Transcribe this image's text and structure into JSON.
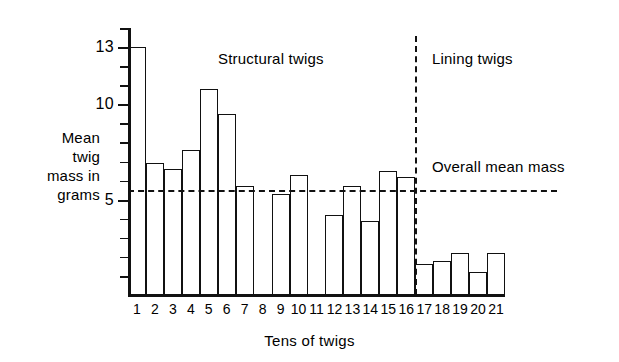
{
  "chart_data": {
    "type": "bar",
    "title": "",
    "xlabel": "Tens of twigs",
    "ylabel": "Mean twig mass in grams",
    "ylabel_lines": [
      "Mean",
      "twig",
      "mass in",
      "grams"
    ],
    "categories": [
      "1",
      "2",
      "3",
      "4",
      "5",
      "6",
      "7",
      "8",
      "9",
      "10",
      "11",
      "12",
      "13",
      "14",
      "15",
      "16",
      "17",
      "18",
      "19",
      "20",
      "21"
    ],
    "values": [
      13.0,
      6.9,
      6.6,
      7.6,
      10.8,
      9.5,
      5.7,
      0,
      5.3,
      6.3,
      0,
      4.2,
      5.7,
      3.9,
      6.5,
      6.2,
      1.6,
      1.8,
      2.2,
      1.2,
      2.2
    ],
    "ylim": [
      0,
      14
    ],
    "xlim": [
      0,
      21
    ],
    "ytick_labels": [
      "5",
      "10",
      "13"
    ],
    "ytick_values": [
      5,
      10,
      13
    ],
    "yminor_ticks": [
      1,
      2,
      3,
      4,
      6,
      7,
      8,
      9,
      11,
      12,
      14
    ],
    "grid": false,
    "legend": "none",
    "annotations": [
      {
        "name": "structural-twigs",
        "text": "Structural twigs",
        "x_category_range": [
          1,
          16
        ]
      },
      {
        "name": "lining-twigs",
        "text": "Lining twigs",
        "x_category_range": [
          17,
          21
        ]
      },
      {
        "name": "overall-mean-mass",
        "text": "Overall mean mass",
        "value": 5.5
      }
    ],
    "reference_lines": [
      {
        "name": "overall-mean-mass-line",
        "orientation": "horizontal",
        "value": 5.5,
        "style": "dashed"
      },
      {
        "name": "group-divider-line",
        "orientation": "vertical",
        "at_category": "16/17 boundary",
        "style": "dashed"
      }
    ],
    "colors": {
      "axis": "#111111",
      "bar_stroke": "#111111",
      "bar_fill": "transparent",
      "background": "#ffffff",
      "reference_line": "#111111"
    }
  },
  "ytick_marks": [
    {
      "value": 13,
      "label": "13",
      "major": true
    },
    {
      "value": 10,
      "label": "10",
      "major": true
    },
    {
      "value": 5,
      "label": "5",
      "major": true
    },
    {
      "value": 14,
      "label": "",
      "major": false
    },
    {
      "value": 12,
      "label": "",
      "major": false
    },
    {
      "value": 11,
      "label": "",
      "major": false
    },
    {
      "value": 9,
      "label": "",
      "major": false
    },
    {
      "value": 8,
      "label": "",
      "major": false
    },
    {
      "value": 7,
      "label": "",
      "major": false
    },
    {
      "value": 6,
      "label": "",
      "major": false
    },
    {
      "value": 4,
      "label": "",
      "major": false
    },
    {
      "value": 3,
      "label": "",
      "major": false
    },
    {
      "value": 2,
      "label": "",
      "major": false
    },
    {
      "value": 1,
      "label": "",
      "major": false
    }
  ]
}
